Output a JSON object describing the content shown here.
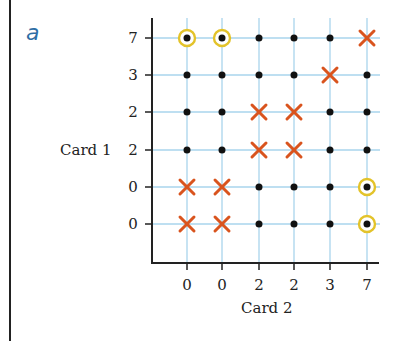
{
  "panel_label": "a",
  "chart_data": {
    "type": "scatter",
    "title": "",
    "xlabel": "Card 2",
    "ylabel": "Card 1",
    "x_tick_labels": [
      "0",
      "0",
      "2",
      "2",
      "3",
      "7"
    ],
    "y_tick_labels_top_to_bottom": [
      "7",
      "3",
      "2",
      "2",
      "0",
      "0"
    ],
    "grid": true,
    "legend": null,
    "marker_legend": {
      "dot": "black dot",
      "circled": "yellow-circled black dot",
      "cross": "red-orange X"
    },
    "colors": {
      "grid": "#a9d4ec",
      "dot": "#111111",
      "circle": "#e3c32a",
      "cross": "#d9541e",
      "axis": "#222222",
      "panel_label": "#2f6ea5"
    },
    "cells": [
      [
        "circled",
        "circled",
        "dot",
        "dot",
        "dot",
        "cross"
      ],
      [
        "dot",
        "dot",
        "dot",
        "dot",
        "cross",
        "dot"
      ],
      [
        "dot",
        "dot",
        "cross",
        "cross",
        "dot",
        "dot"
      ],
      [
        "dot",
        "dot",
        "cross",
        "cross",
        "dot",
        "dot"
      ],
      [
        "cross",
        "cross",
        "dot",
        "dot",
        "dot",
        "circled"
      ],
      [
        "cross",
        "cross",
        "dot",
        "dot",
        "dot",
        "circled"
      ]
    ]
  }
}
